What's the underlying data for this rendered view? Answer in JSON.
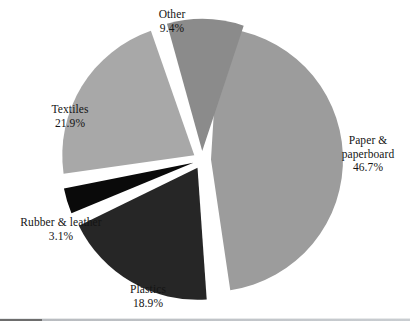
{
  "chart_data": {
    "type": "pie",
    "title": "",
    "subtitle": "",
    "xlabel": "",
    "ylabel": "",
    "legend_position": "none",
    "grid": false,
    "exploded": true,
    "units": "percent",
    "categories": [
      "Paper & paperboard",
      "Plastics",
      "Rubber & leather",
      "Textiles",
      "Other"
    ],
    "values": [
      46.7,
      18.9,
      3.1,
      21.9,
      9.4
    ],
    "slices": [
      {
        "id": "paper",
        "label": "Paper &\npaperboard",
        "label_line1": "Paper &",
        "label_line2": "paperboard",
        "value": 46.7,
        "value_text": "46.7%",
        "color": "#9c9c9c",
        "start_angle": 3.5,
        "end_angle": 171.6,
        "explode_direction_deg": 87.5
      },
      {
        "id": "plastics",
        "label": "Plastics",
        "value": 18.9,
        "value_text": "18.9%",
        "color": "#262626",
        "start_angle": 176.0,
        "end_angle": 244.0,
        "explode_direction_deg": 210.0
      },
      {
        "id": "rubber",
        "label": "Rubber & leather",
        "value": 3.1,
        "value_text": "3.1%",
        "color": "#0a0a0a",
        "start_angle": 247.5,
        "end_angle": 258.7,
        "explode_direction_deg": 253.0
      },
      {
        "id": "textiles",
        "label": "Textiles",
        "value": 21.9,
        "value_text": "21.9%",
        "color": "#a8a8a8",
        "start_angle": 262.0,
        "end_angle": 340.8,
        "explode_direction_deg": 301.0
      },
      {
        "id": "other",
        "label": "Other",
        "value": 9.4,
        "value_text": "9.4%",
        "color": "#8b8b8b",
        "start_angle": 344.5,
        "end_angle": 378.3,
        "explode_direction_deg": 1.5
      }
    ],
    "geometry": {
      "center_x": 202,
      "center_y": 160,
      "radius": 132,
      "explode_offset": 9
    },
    "background_color": "#ffffff",
    "text_color": "#141414"
  }
}
